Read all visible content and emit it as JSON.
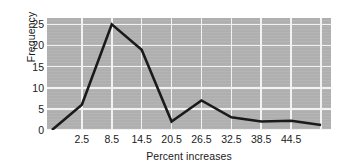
{
  "chart_data": {
    "type": "line",
    "title": "",
    "xlabel": "Percent increases",
    "ylabel": "Frequency",
    "xlim": [
      -4.5,
      52.5
    ],
    "ylim": [
      0,
      26.5
    ],
    "grid": true,
    "legend": null,
    "x_tick_labels": [
      "2.5",
      "8.5",
      "14.5",
      "20.5",
      "26.5",
      "32.5",
      "38.5",
      "44.5"
    ],
    "x_tick_values": [
      2.5,
      8.5,
      14.5,
      20.5,
      26.5,
      32.5,
      38.5,
      44.5
    ],
    "y_tick_labels": [
      "0",
      "5",
      "10",
      "15",
      "20",
      "25"
    ],
    "y_tick_values": [
      0,
      5,
      10,
      15,
      20,
      25
    ],
    "x": [
      -3.5,
      2.5,
      8.5,
      14.5,
      20.5,
      26.5,
      32.5,
      38.5,
      44.5,
      50.5
    ],
    "values": [
      0,
      6,
      25,
      19,
      2,
      7,
      3,
      2,
      2.2,
      1.2
    ],
    "series": [
      {
        "name": "Frequency",
        "color": "#1a1a1a",
        "line_width": 2.6,
        "points": [
          {
            "x": -3.5,
            "y": 0
          },
          {
            "x": 2.5,
            "y": 6
          },
          {
            "x": 8.5,
            "y": 25
          },
          {
            "x": 14.5,
            "y": 19
          },
          {
            "x": 20.5,
            "y": 2
          },
          {
            "x": 26.5,
            "y": 7
          },
          {
            "x": 32.5,
            "y": 3
          },
          {
            "x": 38.5,
            "y": 2
          },
          {
            "x": 44.5,
            "y": 2.2
          },
          {
            "x": 50.5,
            "y": 1.2
          }
        ]
      }
    ],
    "colors": {
      "plot_background": "#b3b3b3",
      "grid": "#f2f2f2",
      "line": "#1a1a1a",
      "text": "#1a1a1a",
      "page_background": "#ffffff"
    }
  }
}
